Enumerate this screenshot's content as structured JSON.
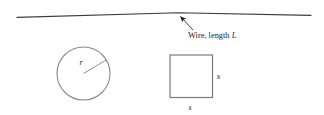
{
  "figure": {
    "name": "wire-circle-square-diagram",
    "background_color": "#ffffff",
    "width": 324,
    "height": 115
  },
  "wire": {
    "label_prefix": "Wire, length ",
    "label_variable": "L",
    "color": "#3d3d3d",
    "stroke_width": 1.1,
    "left_point": [
      17,
      17.4
    ],
    "vertex_point": [
      178,
      12.8
    ],
    "right_point": [
      311,
      15.4
    ]
  },
  "annotation_arrow": {
    "color": "#1a1a1a",
    "tail": [
      193,
      30
    ],
    "head": [
      178.5,
      14.5
    ]
  },
  "circle": {
    "center": [
      83.5,
      73.5
    ],
    "radius": 26.5,
    "stroke_color": "#8a8a8a",
    "stroke_width": 1.1,
    "radius_label": "r",
    "radius_label_position": [
      79.5,
      64.5
    ],
    "radius_line_from": [
      83.5,
      73.5
    ],
    "radius_line_to": [
      106.5,
      59.8
    ]
  },
  "square": {
    "x": 170,
    "y": 55,
    "side_px": 42.5,
    "stroke_color": "#7a7a7a",
    "stroke_width": 1.2,
    "side_label_right": "s",
    "side_label_right_position": [
      217,
      79
    ],
    "side_label_bottom": "s",
    "side_label_bottom_position": [
      188.5,
      110
    ]
  }
}
